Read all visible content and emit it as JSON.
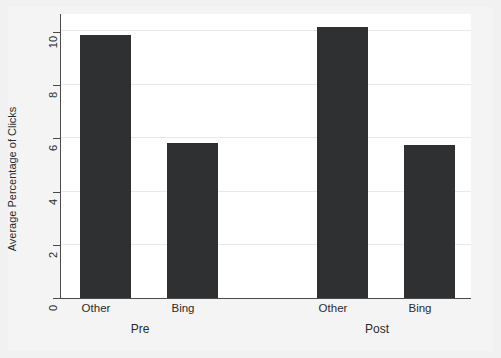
{
  "chart_data": {
    "type": "bar",
    "title": "",
    "subtitle": "",
    "xlabel": "",
    "ylabel": "Average Percentage of Clicks",
    "ylim": [
      0,
      10.6
    ],
    "yticks": [
      0,
      2,
      4,
      6,
      8,
      10
    ],
    "ytick_labels": [
      "0",
      "2",
      "4",
      "6",
      "8",
      "10"
    ],
    "grid": "horizontal",
    "legend": "none",
    "categories": [
      "Other",
      "Bing",
      "Other",
      "Bing"
    ],
    "groups": [
      "Pre",
      "Post"
    ],
    "group_labels": [
      {
        "label": "Pre",
        "categories": [
          "Other",
          "Bing"
        ]
      },
      {
        "label": "Post",
        "categories": [
          "Other",
          "Bing"
        ]
      }
    ],
    "values": [
      9.8,
      5.8,
      10.1,
      5.7
    ],
    "bars": [
      {
        "group": "Pre",
        "category": "Other",
        "value": 9.8
      },
      {
        "group": "Pre",
        "category": "Bing",
        "value": 5.8
      },
      {
        "group": "Post",
        "category": "Other",
        "value": 10.1
      },
      {
        "group": "Post",
        "category": "Bing",
        "value": 5.7
      }
    ],
    "bar_color": "#2f3032",
    "plot_background": "#ffffff",
    "figure_background": "#f1f1f1",
    "gridline_color": "#e9e9ea",
    "axis_color": "#4a4a4a"
  },
  "axis": {
    "y_title": "Average Percentage of Clicks",
    "y_tick_0": "0",
    "y_tick_1": "2",
    "y_tick_2": "4",
    "y_tick_3": "6",
    "y_tick_4": "8",
    "y_tick_5": "10"
  },
  "x_labels": {
    "pre_other": "Other",
    "pre_bing": "Bing",
    "post_other": "Other",
    "post_bing": "Bing",
    "group_pre": "Pre",
    "group_post": "Post"
  }
}
